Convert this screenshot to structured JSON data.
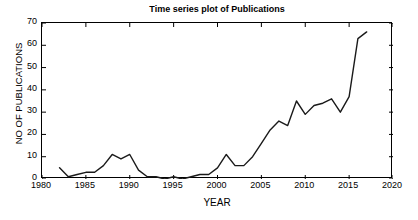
{
  "chart_data": {
    "type": "line",
    "title": "Time series plot of Publications",
    "xlabel": "YEAR",
    "ylabel": "NO OF PUBLICATIONS",
    "xlim": [
      1980,
      2020
    ],
    "ylim": [
      0,
      70
    ],
    "xticks": [
      1980,
      1985,
      1990,
      1995,
      2000,
      2005,
      2010,
      2015,
      2020
    ],
    "xtick_labels": [
      "1980",
      "1985",
      "1990",
      "1995",
      "2000",
      "2005",
      "2010",
      "2015",
      "2020"
    ],
    "yticks": [
      0,
      10,
      20,
      30,
      40,
      50,
      60,
      70
    ],
    "ytick_labels": [
      "0",
      "10",
      "20",
      "30",
      "40",
      "50",
      "60",
      "70"
    ],
    "grid": false,
    "legend": null,
    "line_color": "#1a1a1a",
    "line_width": 1.4,
    "x": [
      1982,
      1983,
      1984,
      1985,
      1986,
      1987,
      1988,
      1989,
      1990,
      1991,
      1992,
      1993,
      1994,
      1995,
      1996,
      1997,
      1998,
      1999,
      2000,
      2001,
      2002,
      2003,
      2004,
      2005,
      2006,
      2007,
      2008,
      2009,
      2010,
      2011,
      2012,
      2013,
      2014,
      2015,
      2016,
      2017
    ],
    "values": [
      5,
      1,
      2,
      3,
      3,
      6,
      11,
      9,
      11,
      4,
      1,
      1,
      0,
      1,
      0,
      1,
      2,
      2,
      5,
      11,
      6,
      6,
      10,
      16,
      22,
      26,
      24,
      35,
      29,
      33,
      34,
      36,
      30,
      37,
      63,
      66
    ],
    "series": [
      {
        "name": "Publications",
        "x": [
          1982,
          1983,
          1984,
          1985,
          1986,
          1987,
          1988,
          1989,
          1990,
          1991,
          1992,
          1993,
          1994,
          1995,
          1996,
          1997,
          1998,
          1999,
          2000,
          2001,
          2002,
          2003,
          2004,
          2005,
          2006,
          2007,
          2008,
          2009,
          2010,
          2011,
          2012,
          2013,
          2014,
          2015,
          2016,
          2017
        ],
        "values": [
          5,
          1,
          2,
          3,
          3,
          6,
          11,
          9,
          11,
          4,
          1,
          1,
          0,
          1,
          0,
          1,
          2,
          2,
          5,
          11,
          6,
          6,
          10,
          16,
          22,
          26,
          24,
          35,
          29,
          33,
          34,
          36,
          30,
          37,
          63,
          66
        ]
      }
    ]
  }
}
